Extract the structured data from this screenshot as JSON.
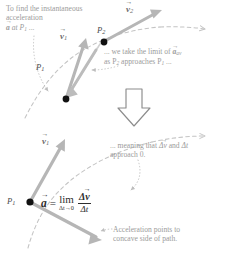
{
  "figure": {
    "type": "physics-vector-diagram",
    "background": "#ffffff"
  },
  "colors": {
    "text_gray": "#9b9b9b",
    "label_gray": "#6b6b6b",
    "equation_black": "#2e2e2e",
    "vector_gray": "#b6b6b6",
    "vector_gray_dark": "#a0a0a0",
    "path_dashed": "#c4c4c4",
    "leader_dotted": "#bdbdbd",
    "point_fill": "#111111",
    "block_arrow_stroke": "#8c8c8c"
  },
  "annotations": {
    "intro": {
      "line1": "To find the instantaneous",
      "line2": "acceleration",
      "line3_vec": "a",
      "line3_rest": " at P",
      "line3_sub": "1",
      "line3_tail": " ..."
    },
    "limit_note": {
      "line1_pre": "... we take the limit of ",
      "line1_vec": "a",
      "line1_sub": "av",
      "line2_pre": "as P",
      "line2_sub1": "2",
      "line2_mid": " approaches P",
      "line2_sub2": "1",
      "line2_tail": " ..."
    },
    "meaning_note": {
      "line1_pre": "... meaning that ",
      "line1_vec": "Δv",
      "line1_mid": " and ",
      "line1_dt": "Δt",
      "line2": "approach 0."
    },
    "caption": {
      "line1": "Acceleration points to",
      "line2": "concave side of path."
    }
  },
  "labels": {
    "v1_top": {
      "symbol": "v",
      "sub": "1"
    },
    "v2_top": {
      "symbol": "v",
      "sub": "2"
    },
    "p2_top": {
      "symbol": "P",
      "sub": "2"
    },
    "p1_top": {
      "symbol": "P",
      "sub": "1"
    },
    "v1_bottom": {
      "symbol": "v",
      "sub": "1"
    },
    "p1_bottom": {
      "symbol": "P",
      "sub": "1"
    }
  },
  "equation": {
    "lhs": "a",
    "equals": "=",
    "lim": "lim",
    "lim_sub": "Δt→0",
    "numerator": "Δv",
    "denominator": "Δt"
  },
  "icons": {
    "down_block_arrow": "down-block-arrow-icon",
    "path_arrowhead": "path-direction-arrowhead"
  }
}
